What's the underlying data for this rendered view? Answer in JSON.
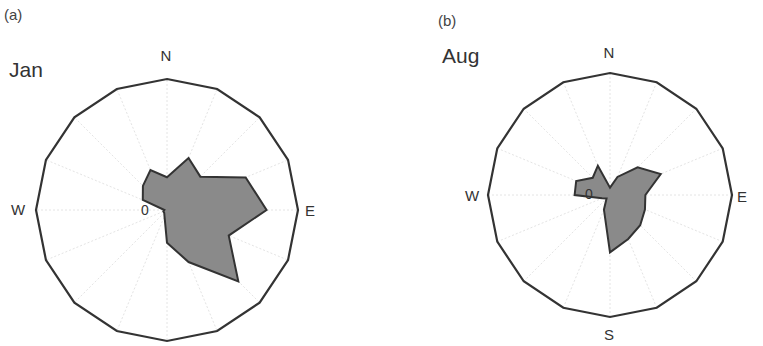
{
  "chart_data": [
    {
      "type": "radar",
      "subtype": "wind-rose",
      "panel_label": "(a)",
      "title": "Jan",
      "directions": [
        "N",
        "NNE",
        "NE",
        "ENE",
        "E",
        "ESE",
        "SE",
        "SSE",
        "S",
        "SSW",
        "SW",
        "WSW",
        "W",
        "WNW",
        "NW",
        "NNW"
      ],
      "values": [
        5,
        8.6,
        7.2,
        13,
        15.2,
        10.2,
        15.4,
        8.6,
        5,
        1,
        0.6,
        0.6,
        0.4,
        4,
        5.2,
        6.6
      ],
      "rmax": 20,
      "center_label": "0",
      "axis_labels": {
        "N": "N",
        "E": "E",
        "W": "W"
      },
      "grid": "16 faint spokes, outer 16-gon ring",
      "fill": "#8a8a8a",
      "stroke": "#333333"
    },
    {
      "type": "radar",
      "subtype": "wind-rose",
      "panel_label": "(b)",
      "title": "Aug",
      "directions": [
        "N",
        "NNE",
        "NE",
        "ENE",
        "E",
        "ESE",
        "SE",
        "SSE",
        "S",
        "SSW",
        "SW",
        "WSW",
        "W",
        "WNW",
        "NW",
        "NNW"
      ],
      "values": [
        1.2,
        3.2,
        6.4,
        9,
        5.8,
        6.2,
        7,
        7.8,
        9.4,
        2.6,
        0.8,
        1.4,
        5.8,
        6,
        4,
        5.2
      ],
      "rmax": 20,
      "center_label": "0",
      "axis_labels": {
        "N": "N",
        "E": "E",
        "S": "S",
        "W": "W"
      },
      "grid": "16 faint spokes, outer 16-gon ring",
      "fill": "#8a8a8a",
      "stroke": "#333333"
    }
  ],
  "panels": [
    {
      "label": "(a)",
      "month": "Jan",
      "n": "N",
      "e": "E",
      "w": "W",
      "zero": "0"
    },
    {
      "label": "(b)",
      "month": "Aug",
      "n": "N",
      "e": "E",
      "s": "S",
      "w": "W",
      "zero": "0"
    }
  ]
}
